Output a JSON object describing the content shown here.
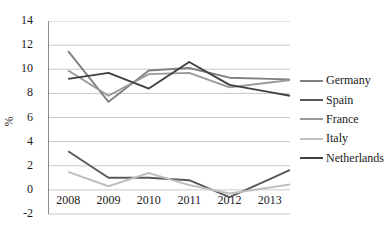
{
  "chart_data": {
    "type": "line",
    "title": "",
    "ylabel": "%",
    "xlabel": "",
    "categories": [
      "2008",
      "2009",
      "2010",
      "2011",
      "2012",
      "2013"
    ],
    "ylim": [
      -2,
      14
    ],
    "yticks": [
      14,
      12,
      10,
      8,
      6,
      4,
      2,
      0,
      -2
    ],
    "grid": "horizontal",
    "legend_position": "right",
    "series": [
      {
        "name": "Germany",
        "color": "#808080",
        "values": [
          11.5,
          7.3,
          9.9,
          10.1,
          9.3,
          9.2
        ]
      },
      {
        "name": "Spain",
        "color": "#595959",
        "values": [
          3.2,
          1.0,
          1.0,
          0.8,
          -0.6,
          0.9
        ]
      },
      {
        "name": "France",
        "color": "#999999",
        "values": [
          9.9,
          7.8,
          9.6,
          9.7,
          8.5,
          8.9
        ]
      },
      {
        "name": "Italy",
        "color": "#bfbfbf",
        "values": [
          1.5,
          0.3,
          1.4,
          0.4,
          -0.3,
          0.2
        ]
      },
      {
        "name": "Netherlands",
        "color": "#404040",
        "values": [
          9.2,
          9.7,
          8.4,
          10.6,
          8.7,
          8.1
        ]
      }
    ]
  },
  "colors": {
    "gridline": "#c8c8c8",
    "axis": "#8c8c8c",
    "text": "#1a1a1a"
  }
}
